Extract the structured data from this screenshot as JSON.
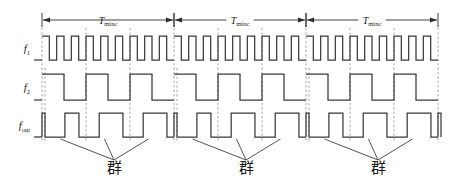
{
  "figure": {
    "type": "timing-diagram",
    "background_color": "#ffffff",
    "wave_color": "#3a3a3a",
    "dash_color": "#9a9a9a",
    "annotation_color": "#2b2b2b"
  },
  "signals": [
    {
      "id": "f1",
      "label_base": "f",
      "label_sub": "1",
      "row_index": 0,
      "description": "High frequency reference square wave, about 9 cycles per Tminc period",
      "cycles_per_period": 9,
      "duty": 0.5
    },
    {
      "id": "f2",
      "label_base": "f",
      "label_sub": "2",
      "row_index": 1,
      "description": "Lower frequency square wave, 3 cycles per Tminc period",
      "cycles_per_period": 3,
      "duty": 0.5
    },
    {
      "id": "fout",
      "label_base": "f",
      "label_sub": "out",
      "row_index": 2,
      "description": "Output beat signal: narrow spike at each period boundary followed by wide pulses",
      "pulses_per_period": 3,
      "duty": 0.5
    }
  ],
  "periods": [
    {
      "index": 1,
      "label_base": "T",
      "label_sub": "minc"
    },
    {
      "index": 2,
      "label_base": "T",
      "label_sub": "minc"
    },
    {
      "index": 3,
      "label_base": "T",
      "label_sub": "minc"
    }
  ],
  "groups": [
    {
      "index": 1,
      "label": "群",
      "leader_count": 3
    },
    {
      "index": 2,
      "label": "群",
      "leader_count": 3
    },
    {
      "index": 3,
      "label": "群",
      "leader_count": 3
    }
  ],
  "geometry": {
    "x_start": 42,
    "x_end": 438,
    "period_width": 132,
    "dim_y": 20,
    "f1_top": 36,
    "f1_bottom": 60,
    "f2_top": 74,
    "f2_bottom": 100,
    "fout_top": 113,
    "fout_bottom": 137,
    "group_label_y": 173
  }
}
